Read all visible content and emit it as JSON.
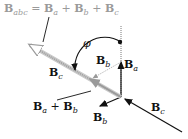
{
  "diagram": {
    "title_label": {
      "base": "B",
      "sub": "abc",
      "rhs": [
        {
          "base": "B",
          "sub": "a"
        },
        {
          "base": "B",
          "sub": "b"
        },
        {
          "base": "B",
          "sub": "c"
        }
      ]
    },
    "labels": {
      "phi": "φ",
      "Bb_upper": {
        "base": "B",
        "sub": "b"
      },
      "Ba": {
        "base": "B",
        "sub": "a"
      },
      "Bc_left": {
        "base": "B",
        "sub": "c"
      },
      "Ba_plus_Bb": {
        "a": {
          "base": "B",
          "sub": "a"
        },
        "b": {
          "base": "B",
          "sub": "b"
        }
      },
      "Bc_right": {
        "base": "B",
        "sub": "c"
      },
      "Bb_lower": {
        "base": "B",
        "sub": "b"
      }
    },
    "colors": {
      "black": "#111111",
      "gray": "#9a9a9a",
      "light_gray": "#c8c8c8"
    }
  }
}
